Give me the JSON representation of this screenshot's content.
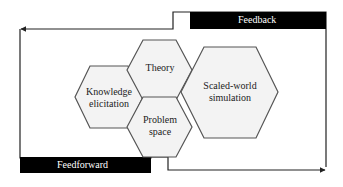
{
  "diagram": {
    "feedback": {
      "label": "Feedback"
    },
    "feedforward": {
      "label": "Feedforward"
    },
    "hexagons": [
      {
        "id": "knowledge",
        "line1": "Knowledge",
        "line2": "elicitation"
      },
      {
        "id": "theory",
        "line1": "Theory",
        "line2": ""
      },
      {
        "id": "problem",
        "line1": "Problem",
        "line2": "space"
      },
      {
        "id": "scaled",
        "line1": "Scaled-world",
        "line2": "simulation"
      }
    ],
    "colors": {
      "bar": "#000000",
      "hex_fill": "#f3f3f3",
      "hex_stroke": "#555555",
      "line": "#222222"
    }
  }
}
